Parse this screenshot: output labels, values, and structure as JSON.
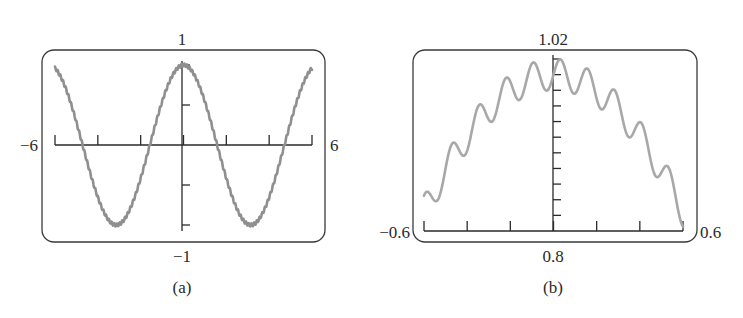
{
  "chart_data": [
    {
      "id": "a",
      "type": "line",
      "title": "",
      "caption": "(a)",
      "function": "cos(x) + sin(50x)/50",
      "xlim": [
        -6,
        6
      ],
      "ylim": [
        -1,
        1
      ],
      "labels": {
        "xmin": "−6",
        "xmax": "6",
        "ymin": "−1",
        "ymax": "1"
      },
      "x_tick_step": 2,
      "y_tick_step": 0.5,
      "grid": false,
      "series": [
        {
          "name": "y = cos(x) + sin(50x)/50",
          "x": [
            -6,
            -5,
            -4,
            -3.14,
            -2,
            -1,
            0,
            1,
            2,
            3.14,
            4,
            5,
            6
          ],
          "values": [
            0.97,
            0.3,
            -0.64,
            -1.0,
            -0.43,
            0.53,
            1.0,
            0.53,
            -0.43,
            -1.0,
            -0.64,
            0.3,
            0.97
          ]
        }
      ],
      "color": "#8f8f8f"
    },
    {
      "id": "b",
      "type": "line",
      "title": "",
      "caption": "(b)",
      "function": "cos(x) + sin(50x)/50",
      "xlim": [
        -0.6,
        0.6
      ],
      "ylim": [
        0.8,
        1.02
      ],
      "labels": {
        "xmin": "−0.6",
        "xmax": "0.6",
        "ymin": "0.8",
        "ymax": "1.02"
      },
      "x_tick_step": 0.2,
      "y_tick_step": 0.02,
      "grid": false,
      "series": [
        {
          "name": "y = cos(x) + sin(50x)/50",
          "x": [
            -0.6,
            -0.54,
            -0.47,
            -0.41,
            -0.35,
            -0.28,
            -0.22,
            -0.16,
            -0.1,
            -0.03,
            0.03,
            0.09,
            0.16,
            0.22,
            0.28,
            0.35,
            0.41,
            0.47,
            0.54,
            0.6
          ],
          "values": [
            0.845,
            0.838,
            0.91,
            0.9,
            0.96,
            0.94,
            0.99,
            0.96,
            1.01,
            0.98,
            1.0,
            0.98,
            0.99,
            0.95,
            0.96,
            0.92,
            0.92,
            0.87,
            0.87,
            0.805
          ]
        }
      ],
      "color": "#a8a8a8"
    }
  ],
  "panels": {
    "a": {
      "caption": "(a)",
      "top_label": "1",
      "bottom_label": "−1",
      "left_label": "−6",
      "right_label": "6"
    },
    "b": {
      "caption": "(b)",
      "top_label": "1.02",
      "bottom_label": "0.8",
      "left_label": "−0.6",
      "right_label": "0.6"
    }
  }
}
